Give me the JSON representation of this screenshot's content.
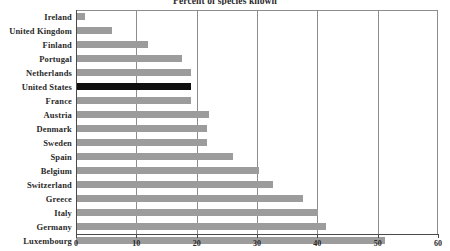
{
  "chart_data": {
    "type": "bar",
    "orientation": "horizontal",
    "title": "Percent of species known",
    "xlabel": "",
    "ylabel": "",
    "xlim": [
      0,
      60
    ],
    "xticks": [
      0,
      10,
      20,
      30,
      40,
      50,
      60
    ],
    "grid": "vertical",
    "legend": "none",
    "highlight_category": "United States",
    "colors": {
      "bar": "#9c9c9c",
      "highlight_bar": "#101010",
      "gridline": "#8d8d8d",
      "axis": "#4a4a4a",
      "text": "#2a2a2a",
      "background": "#ffffff"
    },
    "categories": [
      "Ireland",
      "United Kingdom",
      "Finland",
      "Portugal",
      "Netherlands",
      "United States",
      "France",
      "Austria",
      "Denmark",
      "Sweden",
      "Spain",
      "Belgium",
      "Switzerland",
      "Greece",
      "Italy",
      "Germany",
      "Luxembourg"
    ],
    "values": [
      1.5,
      6,
      12,
      17.5,
      19,
      19,
      19,
      22,
      21.7,
      21.7,
      26,
      30.3,
      32.7,
      37.6,
      40.1,
      41.4,
      51.2
    ]
  }
}
